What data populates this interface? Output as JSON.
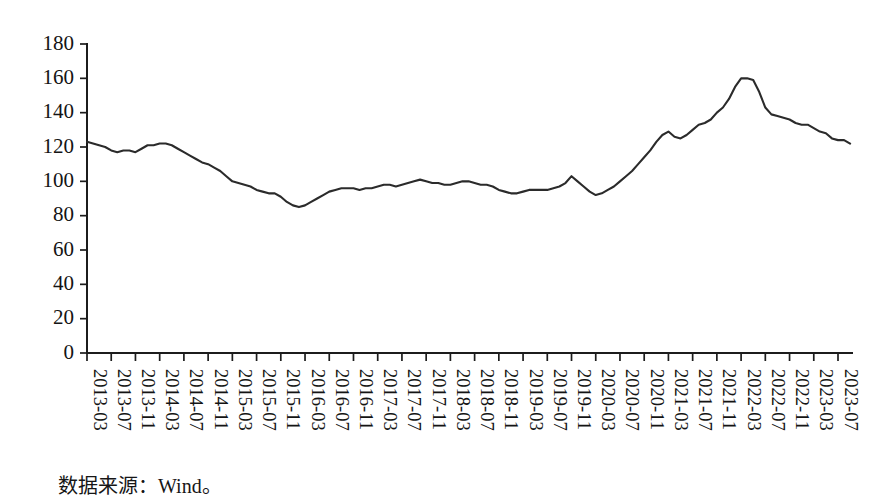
{
  "source_note": "数据来源：Wind。",
  "chart_data": {
    "type": "line",
    "title": "",
    "subtitle": "",
    "xlabel": "",
    "ylabel": "",
    "ylim": [
      0,
      180
    ],
    "ytick_values": [
      0,
      20,
      40,
      60,
      80,
      100,
      120,
      140,
      160,
      180
    ],
    "ytick_labels": [
      "0",
      "20",
      "40",
      "60",
      "80",
      "100",
      "120",
      "140",
      "160",
      "180"
    ],
    "grid": false,
    "legend": null,
    "legend_position": "none",
    "line_color": "#2b2b2b",
    "xtick_labels": [
      "2013-03",
      "2013-07",
      "2013-11",
      "2014-03",
      "2014-07",
      "2014-11",
      "2015-03",
      "2015-07",
      "2015-11",
      "2016-03",
      "2016-07",
      "2016-11",
      "2017-03",
      "2017-07",
      "2017-11",
      "2018-03",
      "2018-07",
      "2018-11",
      "2019-03",
      "2019-07",
      "2019-11",
      "2020-03",
      "2020-07",
      "2020-11",
      "2021-03",
      "2021-07",
      "2021-11",
      "2022-03",
      "2022-07",
      "2022-11",
      "2023-03",
      "2023-07"
    ],
    "x": [
      "2013-03",
      "2013-04",
      "2013-05",
      "2013-06",
      "2013-07",
      "2013-08",
      "2013-09",
      "2013-10",
      "2013-11",
      "2013-12",
      "2014-01",
      "2014-02",
      "2014-03",
      "2014-04",
      "2014-05",
      "2014-06",
      "2014-07",
      "2014-08",
      "2014-09",
      "2014-10",
      "2014-11",
      "2014-12",
      "2015-01",
      "2015-02",
      "2015-03",
      "2015-04",
      "2015-05",
      "2015-06",
      "2015-07",
      "2015-08",
      "2015-09",
      "2015-10",
      "2015-11",
      "2015-12",
      "2016-01",
      "2016-02",
      "2016-03",
      "2016-04",
      "2016-05",
      "2016-06",
      "2016-07",
      "2016-08",
      "2016-09",
      "2016-10",
      "2016-11",
      "2016-12",
      "2017-01",
      "2017-02",
      "2017-03",
      "2017-04",
      "2017-05",
      "2017-06",
      "2017-07",
      "2017-08",
      "2017-09",
      "2017-10",
      "2017-11",
      "2017-12",
      "2018-01",
      "2018-02",
      "2018-03",
      "2018-04",
      "2018-05",
      "2018-06",
      "2018-07",
      "2018-08",
      "2018-09",
      "2018-10",
      "2018-11",
      "2018-12",
      "2019-01",
      "2019-02",
      "2019-03",
      "2019-04",
      "2019-05",
      "2019-06",
      "2019-07",
      "2019-08",
      "2019-09",
      "2019-10",
      "2019-11",
      "2019-12",
      "2020-01",
      "2020-02",
      "2020-03",
      "2020-04",
      "2020-05",
      "2020-06",
      "2020-07",
      "2020-08",
      "2020-09",
      "2020-10",
      "2020-11",
      "2020-12",
      "2021-01",
      "2021-02",
      "2021-03",
      "2021-04",
      "2021-05",
      "2021-06",
      "2021-07",
      "2021-08",
      "2021-09",
      "2021-10",
      "2021-11",
      "2021-12",
      "2022-01",
      "2022-02",
      "2022-03",
      "2022-04",
      "2022-05",
      "2022-06",
      "2022-07",
      "2022-08",
      "2022-09",
      "2022-10",
      "2022-11",
      "2022-12",
      "2023-01",
      "2023-02",
      "2023-03",
      "2023-04",
      "2023-05",
      "2023-06",
      "2023-07",
      "2023-08",
      "2023-09"
    ],
    "values": [
      123,
      122,
      121,
      120,
      118,
      117,
      118,
      118,
      117,
      119,
      121,
      121,
      122,
      122,
      121,
      119,
      117,
      115,
      113,
      111,
      110,
      108,
      106,
      103,
      100,
      99,
      98,
      97,
      95,
      94,
      93,
      93,
      91,
      88,
      86,
      85,
      86,
      88,
      90,
      92,
      94,
      95,
      96,
      96,
      96,
      95,
      96,
      96,
      97,
      98,
      98,
      97,
      98,
      99,
      100,
      101,
      100,
      99,
      99,
      98,
      98,
      99,
      100,
      100,
      99,
      98,
      98,
      97,
      95,
      94,
      93,
      93,
      94,
      95,
      95,
      95,
      95,
      96,
      97,
      99,
      103,
      100,
      97,
      94,
      92,
      93,
      95,
      97,
      100,
      103,
      106,
      110,
      114,
      118,
      123,
      127,
      129,
      126,
      125,
      127,
      130,
      133,
      134,
      136,
      140,
      143,
      148,
      155,
      160,
      160,
      159,
      152,
      143,
      139,
      138,
      137,
      136,
      134,
      133,
      133,
      131,
      129,
      128,
      125,
      124,
      124,
      122
    ]
  }
}
